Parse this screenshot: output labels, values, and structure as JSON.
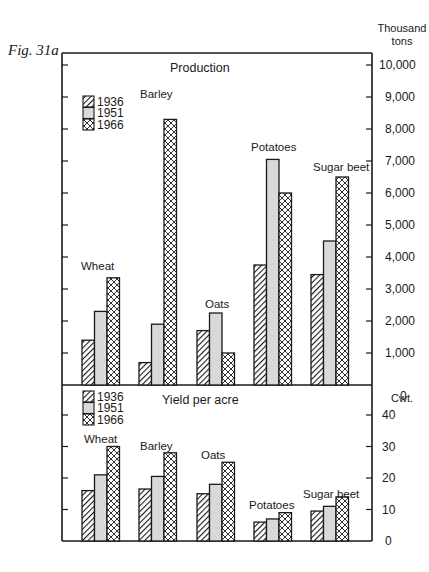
{
  "figure_label": "Fig. 31a",
  "chart_data": [
    {
      "type": "bar",
      "title": "Production",
      "ylabel": "Thousand tons",
      "xlabel": "",
      "ylim": [
        0,
        10000
      ],
      "yticks": [
        "0",
        "1,000",
        "2,000",
        "3,000",
        "4,000",
        "5,000",
        "6,000",
        "7,000",
        "8,000",
        "9,000",
        "10,000"
      ],
      "categories": [
        "Wheat",
        "Barley",
        "Oats",
        "Potatoes",
        "Sugar beet"
      ],
      "series": [
        {
          "name": "1936",
          "pattern": "diagonal-hatch",
          "values": [
            1400,
            700,
            1700,
            3750,
            3450
          ]
        },
        {
          "name": "1951",
          "pattern": "light-grey-fill",
          "values": [
            2300,
            1900,
            2250,
            7050,
            4500
          ]
        },
        {
          "name": "1966",
          "pattern": "cross-hatch",
          "values": [
            3350,
            8300,
            1000,
            6000,
            6500
          ]
        }
      ],
      "legend_position": "upper-left",
      "grid": false
    },
    {
      "type": "bar",
      "title": "Yield per acre",
      "ylabel": "Cwt.",
      "xlabel": "",
      "ylim": [
        0,
        40
      ],
      "yticks": [
        "0",
        "10",
        "20",
        "30",
        "40"
      ],
      "categories": [
        "Wheat",
        "Barley",
        "Oats",
        "Potatoes",
        "Sugar beet"
      ],
      "series": [
        {
          "name": "1936",
          "pattern": "diagonal-hatch",
          "values": [
            16,
            16.5,
            15,
            6,
            9.5
          ]
        },
        {
          "name": "1951",
          "pattern": "light-grey-fill",
          "values": [
            21,
            20.5,
            18,
            7,
            11
          ]
        },
        {
          "name": "1966",
          "pattern": "cross-hatch",
          "values": [
            30,
            28,
            25,
            9,
            14
          ]
        }
      ],
      "legend_position": "upper-left",
      "grid": false
    }
  ],
  "colors": {
    "ink": "#1a1a1a",
    "fill_1951": "#d9d9d9",
    "background": "#ffffff"
  }
}
